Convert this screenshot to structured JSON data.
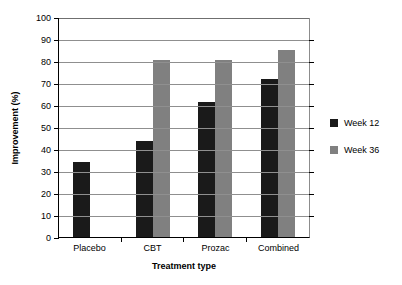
{
  "chart_data": {
    "type": "bar",
    "title": "",
    "xlabel": "Treatment type",
    "ylabel": "Improvement (%)",
    "categories": [
      "Placebo",
      "CBT",
      "Prozac",
      "Combined"
    ],
    "series": [
      {
        "name": "Week 12",
        "color": "#1a1a1a",
        "values": [
          34,
          43.5,
          61.5,
          72
        ]
      },
      {
        "name": "Week 36",
        "color": "#808080",
        "values": [
          null,
          80.5,
          80.5,
          85
        ]
      }
    ],
    "ylim": [
      0,
      100
    ],
    "ytick_step": 10,
    "yticks": [
      0,
      10,
      20,
      30,
      40,
      50,
      60,
      70,
      80,
      90,
      100
    ],
    "ytick_labels": [
      "0",
      "10",
      "20",
      "30",
      "40",
      "50",
      "60",
      "70",
      "80",
      "90",
      "100"
    ],
    "grid": true,
    "grid_axis": "y",
    "legend_position": "right",
    "legend": [
      {
        "label": "Week 12",
        "swatch": "#1a1a1a"
      },
      {
        "label": "Week 36",
        "swatch": "#808080"
      }
    ]
  },
  "axes": {
    "y_title": "Improvement (%)",
    "x_title": "Treatment type"
  }
}
